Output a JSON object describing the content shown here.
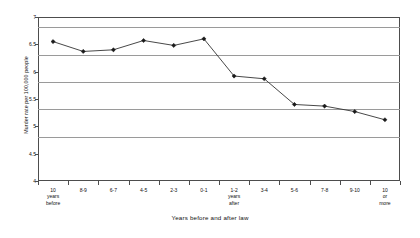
{
  "chart_data": {
    "type": "line",
    "title": "",
    "xlabel": "Years before and after law",
    "ylabel": "Murder rate per 100,000 people",
    "ylim": [
      4,
      7
    ],
    "ytick_values": [
      4,
      4.5,
      5,
      5.5,
      6,
      6.5,
      7
    ],
    "ytick_labels": [
      "4",
      "4.5",
      "5",
      "5.5",
      "6",
      "6.5",
      "7"
    ],
    "grid": true,
    "legend": "none",
    "marker": "diamond",
    "line_color": "#333333",
    "marker_color": "#1a1a1a",
    "grid_color": "#9a9a9a",
    "axis_color": "#4d4d4d",
    "categories": [
      "10 years before",
      "8-9",
      "6-7",
      "4-5",
      "2-3",
      "0-1",
      "1-2 years after",
      "3-4",
      "5-6",
      "7-8",
      "9-10",
      "10 or more"
    ],
    "category_lines": [
      [
        "10",
        "years",
        "before"
      ],
      [
        "8-9"
      ],
      [
        "6-7"
      ],
      [
        "4-5"
      ],
      [
        "2-3"
      ],
      [
        "0-1"
      ],
      [
        "1-2",
        "years",
        "after"
      ],
      [
        "3-4"
      ],
      [
        "5-6"
      ],
      [
        "7-8"
      ],
      [
        "9-10"
      ],
      [
        "10",
        "or",
        "more"
      ]
    ],
    "values": [
      6.55,
      6.37,
      6.4,
      6.57,
      6.48,
      6.6,
      5.92,
      5.87,
      5.4,
      5.37,
      5.27,
      5.12
    ]
  }
}
